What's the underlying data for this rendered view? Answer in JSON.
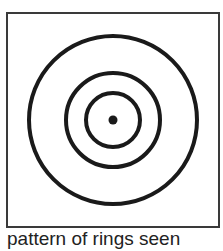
{
  "figure": {
    "caption": "pattern of rings seen",
    "stroke_color": "#1a1a1a",
    "rings": [
      {
        "name": "outer",
        "r": 84
      },
      {
        "name": "middle",
        "r": 47
      },
      {
        "name": "inner",
        "r": 27
      }
    ],
    "center_dot_r": 4.5
  }
}
